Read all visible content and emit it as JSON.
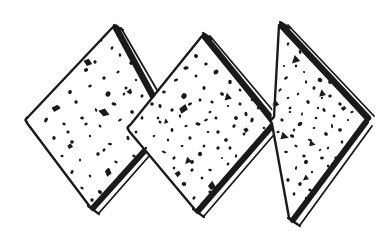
{
  "artwork": {
    "title": "Three overlapping diamond crackers",
    "description": "Hand-drawn black ink illustration of three speckled diamond-shaped crackers arranged in a zigzag overlapping row",
    "style": "pen-and-ink line drawing",
    "background_color": "#ffffff",
    "ink_color": "#1a1a1a",
    "canvas": {
      "width": 392,
      "height": 231
    }
  },
  "shapes": [
    {
      "name": "diamond-left",
      "label": "Left cracker",
      "vertices": {
        "left": [
          26,
          121
        ],
        "top": [
          115,
          26
        ],
        "right": [
          166,
          126
        ],
        "bottom": [
          91,
          207
        ]
      },
      "edge_style": "thick doubled edge on upper-right and lower-right",
      "speckle_count": 58
    },
    {
      "name": "diamond-center",
      "label": "Center cracker",
      "vertices": {
        "left": [
          128,
          129
        ],
        "top": [
          204,
          35
        ],
        "right": [
          272,
          124
        ],
        "bottom": [
          196,
          210
        ]
      },
      "edge_style": "thick doubled edge on upper-right and lower-right",
      "speckle_count": 74
    },
    {
      "name": "diamond-right",
      "label": "Right cracker",
      "vertices": {
        "left": [
          271,
          122
        ],
        "top": [
          281,
          24
        ],
        "right": [
          366,
          120
        ],
        "bottom": [
          291,
          219
        ]
      },
      "edge_style": "thick doubled edge on upper-right and lower-right",
      "speckle_count": 62
    }
  ],
  "speckles": {
    "left": [
      [
        100,
        40,
        1.6
      ],
      [
        112,
        48,
        1.3
      ],
      [
        78,
        58,
        1.8
      ],
      [
        95,
        62,
        1.2
      ],
      [
        120,
        55,
        1.4
      ],
      [
        131,
        63,
        1.5
      ],
      [
        64,
        74,
        1.3
      ],
      [
        86,
        70,
        2.2
      ],
      [
        104,
        78,
        1.4
      ],
      [
        118,
        72,
        1.2
      ],
      [
        136,
        80,
        1.6
      ],
      [
        148,
        74,
        1.3
      ],
      [
        52,
        88,
        1.5
      ],
      [
        70,
        92,
        1.4
      ],
      [
        90,
        86,
        1.3
      ],
      [
        108,
        94,
        1.8
      ],
      [
        126,
        88,
        1.2
      ],
      [
        142,
        96,
        1.5
      ],
      [
        40,
        104,
        1.4
      ],
      [
        58,
        108,
        1.7
      ],
      [
        76,
        102,
        1.2
      ],
      [
        96,
        110,
        1.3
      ],
      [
        114,
        104,
        1.6
      ],
      [
        132,
        112,
        1.4
      ],
      [
        150,
        106,
        1.3
      ],
      [
        46,
        120,
        1.5
      ],
      [
        64,
        124,
        1.2
      ],
      [
        82,
        118,
        1.4
      ],
      [
        100,
        126,
        1.3
      ],
      [
        120,
        120,
        1.5
      ],
      [
        138,
        128,
        1.7
      ],
      [
        154,
        122,
        1.2
      ],
      [
        54,
        138,
        1.3
      ],
      [
        72,
        142,
        1.5
      ],
      [
        90,
        136,
        1.2
      ],
      [
        110,
        144,
        1.4
      ],
      [
        128,
        138,
        1.6
      ],
      [
        146,
        146,
        1.3
      ],
      [
        62,
        156,
        1.4
      ],
      [
        80,
        160,
        1.2
      ],
      [
        98,
        154,
        1.5
      ],
      [
        116,
        162,
        1.3
      ],
      [
        134,
        156,
        1.4
      ],
      [
        72,
        172,
        1.5
      ],
      [
        90,
        176,
        1.3
      ],
      [
        108,
        170,
        1.2
      ],
      [
        124,
        178,
        1.4
      ],
      [
        82,
        188,
        1.3
      ],
      [
        100,
        192,
        1.5
      ],
      [
        116,
        186,
        1.2
      ],
      [
        92,
        200,
        1.3
      ],
      [
        60,
        64,
        1.2
      ],
      [
        146,
        112,
        1.4
      ],
      [
        44,
        96,
        1.2
      ],
      [
        124,
        94,
        1.3
      ],
      [
        68,
        132,
        1.2
      ],
      [
        104,
        150,
        1.3
      ],
      [
        86,
        124,
        1.2
      ]
    ],
    "left_big": [
      [
        88,
        62,
        4.5
      ],
      [
        56,
        108,
        4.2
      ],
      [
        104,
        112,
        5.2
      ],
      [
        108,
        172,
        4.6
      ],
      [
        130,
        92,
        3.2
      ],
      [
        70,
        146,
        3.0
      ]
    ],
    "center": [
      [
        196,
        56,
        1.4
      ],
      [
        186,
        68,
        1.7
      ],
      [
        206,
        64,
        1.2
      ],
      [
        176,
        80,
        1.5
      ],
      [
        196,
        76,
        1.3
      ],
      [
        216,
        72,
        1.6
      ],
      [
        230,
        82,
        1.4
      ],
      [
        164,
        92,
        1.3
      ],
      [
        184,
        96,
        2.0
      ],
      [
        204,
        88,
        1.5
      ],
      [
        222,
        94,
        1.2
      ],
      [
        240,
        90,
        1.4
      ],
      [
        252,
        100,
        1.3
      ],
      [
        152,
        104,
        1.5
      ],
      [
        172,
        110,
        1.3
      ],
      [
        190,
        104,
        1.6
      ],
      [
        210,
        112,
        1.4
      ],
      [
        228,
        106,
        1.2
      ],
      [
        246,
        114,
        1.5
      ],
      [
        258,
        108,
        1.3
      ],
      [
        142,
        118,
        1.4
      ],
      [
        160,
        122,
        1.6
      ],
      [
        180,
        116,
        1.2
      ],
      [
        198,
        124,
        1.8
      ],
      [
        216,
        118,
        1.4
      ],
      [
        234,
        126,
        1.3
      ],
      [
        252,
        120,
        1.5
      ],
      [
        264,
        128,
        1.2
      ],
      [
        136,
        132,
        1.5
      ],
      [
        154,
        136,
        1.3
      ],
      [
        172,
        130,
        1.4
      ],
      [
        190,
        138,
        1.6
      ],
      [
        208,
        132,
        1.2
      ],
      [
        226,
        140,
        1.5
      ],
      [
        244,
        134,
        1.3
      ],
      [
        258,
        142,
        1.4
      ],
      [
        146,
        148,
        1.3
      ],
      [
        164,
        152,
        1.5
      ],
      [
        182,
        146,
        1.2
      ],
      [
        200,
        154,
        1.7
      ],
      [
        218,
        148,
        1.4
      ],
      [
        236,
        156,
        1.3
      ],
      [
        250,
        150,
        1.5
      ],
      [
        156,
        164,
        1.4
      ],
      [
        174,
        168,
        1.2
      ],
      [
        192,
        162,
        1.5
      ],
      [
        210,
        170,
        1.3
      ],
      [
        228,
        164,
        1.4
      ],
      [
        242,
        172,
        1.2
      ],
      [
        166,
        180,
        1.3
      ],
      [
        184,
        184,
        1.5
      ],
      [
        202,
        178,
        1.2
      ],
      [
        218,
        186,
        1.4
      ],
      [
        176,
        194,
        1.3
      ],
      [
        194,
        198,
        1.4
      ],
      [
        210,
        192,
        1.2
      ],
      [
        190,
        206,
        1.3
      ],
      [
        200,
        100,
        1.5
      ],
      [
        218,
        132,
        1.3
      ],
      [
        168,
        140,
        1.2
      ],
      [
        236,
        118,
        1.4
      ],
      [
        186,
        126,
        1.2
      ],
      [
        204,
        146,
        1.3
      ],
      [
        222,
        158,
        1.2
      ],
      [
        158,
        118,
        1.3
      ],
      [
        240,
        104,
        1.2
      ],
      [
        174,
        158,
        1.4
      ],
      [
        212,
        102,
        1.2
      ],
      [
        230,
        148,
        1.3
      ],
      [
        192,
        170,
        1.2
      ],
      [
        206,
        120,
        1.4
      ],
      [
        160,
        106,
        1.2
      ]
    ],
    "center_big": [
      [
        183,
        109,
        5.0
      ],
      [
        228,
        98,
        5.2
      ],
      [
        166,
        122,
        3.2
      ],
      [
        188,
        160,
        5.0
      ],
      [
        212,
        186,
        4.6
      ],
      [
        178,
        174,
        3.0
      ],
      [
        246,
        130,
        3.0
      ]
    ],
    "right": [
      [
        288,
        44,
        1.4
      ],
      [
        300,
        52,
        1.2
      ],
      [
        276,
        58,
        1.6
      ],
      [
        296,
        66,
        1.3
      ],
      [
        312,
        60,
        1.5
      ],
      [
        326,
        68,
        1.4
      ],
      [
        268,
        72,
        1.3
      ],
      [
        286,
        78,
        1.5
      ],
      [
        304,
        72,
        1.2
      ],
      [
        320,
        80,
        1.6
      ],
      [
        336,
        74,
        1.3
      ],
      [
        280,
        90,
        1.4
      ],
      [
        298,
        94,
        1.3
      ],
      [
        314,
        88,
        1.7
      ],
      [
        330,
        96,
        1.2
      ],
      [
        344,
        90,
        1.4
      ],
      [
        272,
        104,
        1.5
      ],
      [
        290,
        108,
        1.3
      ],
      [
        308,
        102,
        1.4
      ],
      [
        324,
        110,
        1.6
      ],
      [
        340,
        104,
        1.2
      ],
      [
        352,
        112,
        1.3
      ],
      [
        282,
        120,
        1.4
      ],
      [
        300,
        124,
        1.5
      ],
      [
        316,
        118,
        1.2
      ],
      [
        332,
        126,
        1.4
      ],
      [
        348,
        120,
        1.3
      ],
      [
        292,
        136,
        1.5
      ],
      [
        310,
        140,
        1.3
      ],
      [
        326,
        134,
        1.4
      ],
      [
        342,
        142,
        1.2
      ],
      [
        286,
        152,
        1.3
      ],
      [
        304,
        156,
        1.5
      ],
      [
        320,
        150,
        1.2
      ],
      [
        336,
        158,
        1.4
      ],
      [
        296,
        168,
        1.3
      ],
      [
        312,
        172,
        1.4
      ],
      [
        328,
        166,
        1.2
      ],
      [
        300,
        184,
        1.5
      ],
      [
        316,
        188,
        1.3
      ],
      [
        288,
        180,
        1.2
      ],
      [
        306,
        198,
        1.3
      ],
      [
        294,
        194,
        1.2
      ],
      [
        300,
        208,
        1.3
      ],
      [
        306,
        82,
        1.4
      ],
      [
        290,
        112,
        1.2
      ],
      [
        322,
        98,
        1.3
      ],
      [
        278,
        132,
        1.4
      ],
      [
        334,
        116,
        1.2
      ],
      [
        296,
        146,
        1.3
      ],
      [
        314,
        128,
        1.2
      ],
      [
        288,
        98,
        1.4
      ],
      [
        328,
        148,
        1.2
      ],
      [
        302,
        114,
        1.3
      ],
      [
        340,
        130,
        1.2
      ],
      [
        284,
        66,
        1.3
      ],
      [
        318,
        108,
        1.2
      ],
      [
        306,
        162,
        1.3
      ],
      [
        294,
        130,
        1.2
      ],
      [
        330,
        82,
        1.4
      ],
      [
        310,
        190,
        1.2
      ],
      [
        322,
        158,
        1.3
      ]
    ],
    "right_big": [
      [
        296,
        60,
        5.0
      ],
      [
        322,
        94,
        4.2
      ],
      [
        284,
        136,
        4.8
      ],
      [
        312,
        144,
        4.6
      ],
      [
        306,
        178,
        4.4
      ],
      [
        344,
        108,
        3.0
      ],
      [
        276,
        104,
        3.0
      ]
    ]
  },
  "meta": {
    "caption": ""
  }
}
